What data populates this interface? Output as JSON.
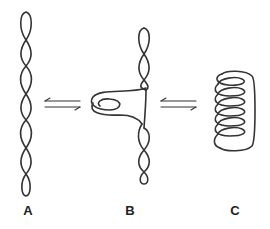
{
  "figure": {
    "panels": [
      {
        "id": "A",
        "label": "A",
        "description": "interwound (plectonemic) supercoil",
        "label_x": 18
      },
      {
        "id": "B",
        "label": "B",
        "description": "intermediate with partially wrapped loop",
        "label_x": 120
      },
      {
        "id": "C",
        "label": "C",
        "description": "toroidal (solenoidal) supercoil",
        "label_x": 225
      }
    ],
    "arrows": [
      {
        "from": "A",
        "to": "B",
        "type": "equilibrium-arrows"
      },
      {
        "from": "B",
        "to": "C",
        "type": "equilibrium-arrows"
      }
    ],
    "colors": {
      "stroke": "#333333",
      "background": "#ffffff",
      "label": "#222222"
    }
  }
}
